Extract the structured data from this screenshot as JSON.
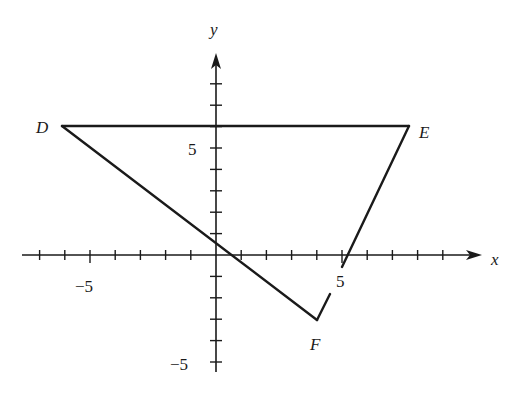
{
  "figure": {
    "type": "coordinate-plane-triangle",
    "axes": {
      "x_label": "x",
      "y_label": "y",
      "x_ticks": {
        "min": -7,
        "max": 9,
        "step": 1
      },
      "y_ticks": {
        "min": -5,
        "max": 8,
        "step": 1
      },
      "tick_labels": {
        "x_neg": "−5",
        "x_pos": "5",
        "y_pos": "5",
        "y_neg": "−5"
      }
    },
    "vertices": [
      {
        "name": "D",
        "x": -6,
        "y": 6
      },
      {
        "name": "E",
        "x": 7.6,
        "y": 6
      },
      {
        "name": "F",
        "x": 4,
        "y": -3
      }
    ],
    "labels": {
      "D": "D",
      "E": "E",
      "F": "F"
    },
    "colors": {
      "line": "#1a1a1a",
      "background": "#ffffff"
    }
  }
}
